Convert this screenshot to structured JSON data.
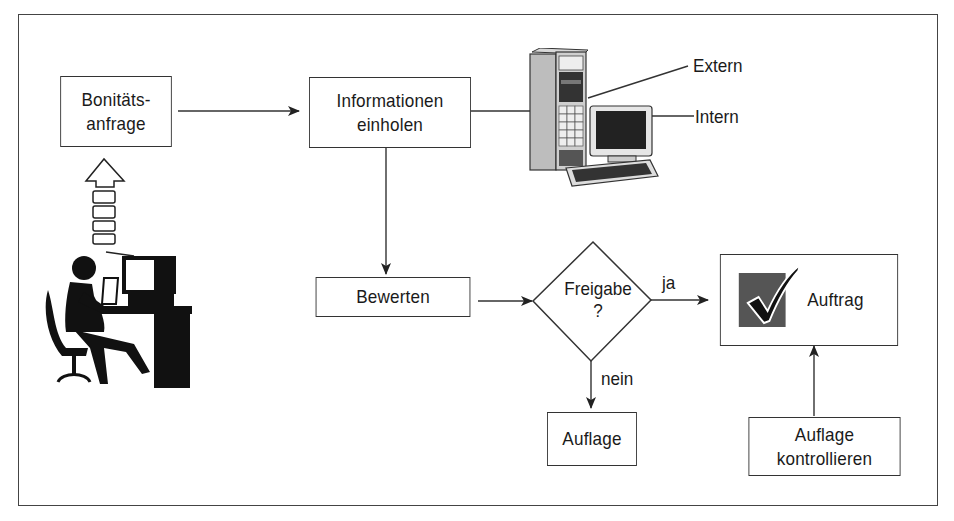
{
  "diagram": {
    "type": "flowchart",
    "language": "de",
    "nodes": {
      "bonitaetsanfrage": {
        "line1": "Bonitäts-",
        "line2": "anfrage",
        "shape": "rectangle"
      },
      "informationen": {
        "line1": "Informationen",
        "line2": "einholen",
        "shape": "rectangle"
      },
      "bewerten": {
        "label": "Bewerten",
        "shape": "rectangle"
      },
      "freigabe": {
        "line1": "Freigabe",
        "line2": "?",
        "shape": "diamond"
      },
      "auflage": {
        "label": "Auflage",
        "shape": "rectangle"
      },
      "auftrag": {
        "label": "Auftrag",
        "shape": "rectangle",
        "icon": "checkmark-icon"
      },
      "auflage_kontrollieren": {
        "line1": "Auflage",
        "line2": "kontrollieren",
        "shape": "rectangle"
      }
    },
    "edge_labels": {
      "ja": "ja",
      "nein": "nein",
      "extern": "Extern",
      "intern": "Intern"
    },
    "edges": [
      {
        "from": "bonitaetsanfrage",
        "to": "informationen"
      },
      {
        "from": "computer",
        "to": "informationen"
      },
      {
        "from": "informationen",
        "to": "bewerten"
      },
      {
        "from": "bewerten",
        "to": "freigabe"
      },
      {
        "from": "freigabe",
        "to": "auftrag",
        "label": "ja"
      },
      {
        "from": "freigabe",
        "to": "auflage",
        "label": "nein"
      },
      {
        "from": "auflage_kontrollieren",
        "to": "auftrag"
      },
      {
        "from": "person",
        "to": "bonitaetsanfrage",
        "style": "block-arrow"
      }
    ],
    "illustrations": [
      "person-at-computer-icon",
      "server-tower-icon",
      "desktop-computer-icon"
    ],
    "colors": {
      "line": "#333333",
      "checkbox_fill": "#555555",
      "background": "#ffffff"
    }
  }
}
